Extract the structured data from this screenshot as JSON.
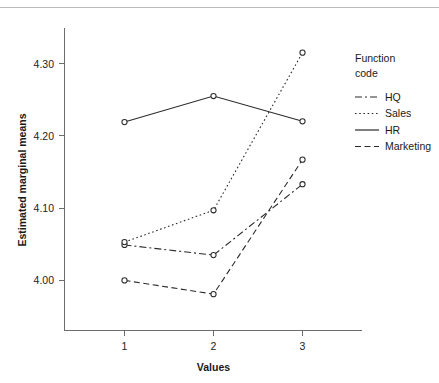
{
  "chart_data": {
    "type": "line",
    "title": "",
    "xlabel": "Values",
    "ylabel": "Estimated marginal means",
    "categories": [
      "1",
      "2",
      "3"
    ],
    "x": [
      1,
      2,
      3
    ],
    "ylim": [
      3.945,
      4.335
    ],
    "yticks": [
      4.0,
      4.1,
      4.2,
      4.3
    ],
    "ytick_labels": [
      "4.00",
      "4.10",
      "4.20",
      "4.30"
    ],
    "xtick_labels": [
      "1",
      "2",
      "3"
    ],
    "grid": false,
    "legend_position": "right",
    "legend_title_line1": "Function",
    "legend_title_line2": "code",
    "series": [
      {
        "name": "HQ",
        "linestyle": "dash-dot",
        "dasharray": "7,3,2,3",
        "values": [
          4.049,
          4.035,
          4.133
        ]
      },
      {
        "name": "Sales",
        "linestyle": "dotted",
        "dasharray": "1.6,2.6",
        "values": [
          4.053,
          4.097,
          4.315
        ]
      },
      {
        "name": "HR",
        "linestyle": "solid",
        "dasharray": "none",
        "values": [
          4.219,
          4.255,
          4.22
        ]
      },
      {
        "name": "Marketing",
        "linestyle": "dashed",
        "dasharray": "6,3.5",
        "values": [
          4.0,
          3.981,
          4.167
        ]
      }
    ]
  },
  "colors": {
    "line": "#2b2b2b",
    "axis": "#6d6d6d",
    "text": "#1a1a1a",
    "background": "#ffffff",
    "rule": "#b9b9b9"
  }
}
